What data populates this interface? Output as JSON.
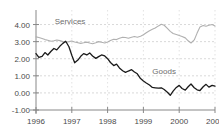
{
  "chart_data": {
    "type": "line",
    "title": "",
    "xlabel": "",
    "ylabel": "",
    "xlim": [
      1996,
      2001
    ],
    "ylim": [
      -1.0,
      4.5
    ],
    "grid": true,
    "legend_position": "inline-annotations",
    "y_ticks": [
      "4.00",
      "3.00",
      "2.00",
      "1.00",
      "0.00",
      "-1.00"
    ],
    "y_tick_values": [
      4.0,
      3.0,
      2.0,
      1.0,
      0.0,
      -1.0
    ],
    "x_ticks": [
      "1996",
      "1997",
      "1998",
      "1999",
      "2000",
      "2001"
    ],
    "x_tick_values": [
      1996,
      1997,
      1998,
      1999,
      2000,
      2001
    ],
    "series": [
      {
        "name": "Services",
        "color": "#b0b0b0",
        "label_x": 1996.95,
        "label_y": 4.05,
        "x": [
          1996.0,
          1996.08,
          1996.17,
          1996.25,
          1996.33,
          1996.42,
          1996.5,
          1996.58,
          1996.67,
          1996.75,
          1996.83,
          1996.92,
          1997.0,
          1997.08,
          1997.17,
          1997.25,
          1997.33,
          1997.42,
          1997.5,
          1997.58,
          1997.67,
          1997.75,
          1997.83,
          1997.92,
          1998.0,
          1998.08,
          1998.17,
          1998.25,
          1998.33,
          1998.42,
          1998.5,
          1998.58,
          1998.67,
          1998.75,
          1998.83,
          1998.92,
          1999.0,
          1999.08,
          1999.17,
          1999.25,
          1999.33,
          1999.42,
          1999.5,
          1999.58,
          1999.67,
          1999.75,
          1999.83,
          1999.92,
          2000.0,
          2000.08,
          2000.17,
          2000.25,
          2000.33,
          2000.42,
          2000.5,
          2000.58,
          2000.67,
          2000.75,
          2000.83,
          2000.92,
          2001.0
        ],
        "y": [
          3.28,
          3.24,
          3.18,
          3.12,
          3.08,
          3.02,
          3.05,
          3.1,
          3.06,
          3.0,
          2.96,
          3.0,
          3.04,
          2.98,
          2.94,
          2.9,
          2.93,
          2.97,
          2.92,
          2.88,
          2.94,
          3.0,
          2.96,
          2.92,
          2.98,
          3.06,
          3.14,
          3.12,
          3.2,
          3.26,
          3.24,
          3.2,
          3.26,
          3.3,
          3.26,
          3.32,
          3.4,
          3.52,
          3.64,
          3.72,
          3.8,
          3.92,
          4.02,
          3.96,
          3.78,
          3.6,
          3.48,
          3.42,
          3.36,
          3.3,
          3.22,
          3.05,
          2.92,
          3.1,
          3.5,
          3.86,
          3.94,
          3.9,
          3.96,
          4.0,
          3.92
        ]
      },
      {
        "name": "Goods",
        "color": "#1a1a1a",
        "label_x": 1999.58,
        "label_y": 1.12,
        "x": [
          1996.0,
          1996.08,
          1996.17,
          1996.25,
          1996.33,
          1996.42,
          1996.5,
          1996.58,
          1996.67,
          1996.75,
          1996.83,
          1996.92,
          1997.0,
          1997.08,
          1997.17,
          1997.25,
          1997.33,
          1997.42,
          1997.5,
          1997.58,
          1997.67,
          1997.75,
          1997.83,
          1997.92,
          1998.0,
          1998.08,
          1998.17,
          1998.25,
          1998.33,
          1998.42,
          1998.5,
          1998.58,
          1998.67,
          1998.75,
          1998.83,
          1998.92,
          1999.0,
          1999.08,
          1999.17,
          1999.25,
          1999.33,
          1999.42,
          1999.5,
          1999.58,
          1999.67,
          1999.75,
          1999.83,
          1999.92,
          2000.0,
          2000.08,
          2000.17,
          2000.25,
          2000.33,
          2000.42,
          2000.5,
          2000.58,
          2000.67,
          2000.75,
          2000.83,
          2000.92,
          2001.0
        ],
        "y": [
          2.3,
          2.08,
          2.14,
          2.36,
          2.22,
          2.44,
          2.6,
          2.52,
          2.74,
          2.9,
          3.02,
          2.7,
          2.2,
          1.76,
          1.92,
          2.14,
          2.3,
          2.22,
          2.34,
          2.16,
          2.02,
          2.12,
          2.22,
          2.16,
          2.0,
          1.78,
          1.6,
          1.68,
          1.46,
          1.3,
          1.2,
          1.28,
          1.36,
          1.22,
          1.12,
          0.84,
          0.7,
          0.58,
          0.46,
          0.32,
          0.3,
          0.28,
          0.3,
          0.2,
          0.04,
          -0.14,
          0.1,
          0.32,
          0.44,
          0.26,
          0.16,
          0.36,
          0.52,
          0.3,
          0.18,
          0.14,
          0.36,
          0.5,
          0.34,
          0.44,
          0.4
        ]
      }
    ],
    "annotations": [
      {
        "text": "Services",
        "x": 1996.95,
        "y": 4.05
      },
      {
        "text": "Goods",
        "x": 1999.58,
        "y": 1.12
      }
    ]
  }
}
